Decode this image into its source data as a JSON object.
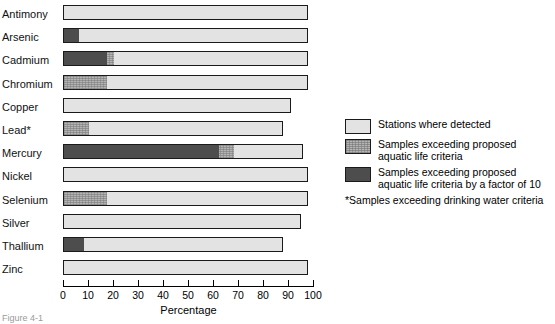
{
  "chart_data": {
    "type": "bar",
    "orientation": "horizontal",
    "stacked": true,
    "title": "",
    "xlabel": "Percentage",
    "ylabel": "",
    "xlim": [
      0,
      100
    ],
    "xticks": [
      0,
      10,
      20,
      30,
      40,
      50,
      60,
      70,
      80,
      90,
      100
    ],
    "xtick_labels": [
      "0",
      "10",
      "20",
      "30",
      "40",
      "50",
      "60",
      "70",
      "80",
      "90",
      "100"
    ],
    "grid": false,
    "legend_position": "right",
    "categories": [
      "Antimony",
      "Arsenic",
      "Cadmium",
      "Chromium",
      "Copper",
      "Lead*",
      "Mercury",
      "Nickel",
      "Selenium",
      "Silver",
      "Thallium",
      "Zinc"
    ],
    "series": [
      {
        "name": "Stations where detected",
        "key": "detected",
        "color": "#e3e3e3",
        "values": [
          98,
          98,
          98,
          98,
          91,
          88,
          96,
          98,
          98,
          95,
          88,
          98
        ]
      },
      {
        "name": "Samples exceeding proposed aquatic life criteria",
        "key": "aquatic",
        "color": "#b4b4b4",
        "values": [
          0,
          6,
          20,
          17,
          0,
          10,
          68,
          0,
          17,
          0,
          8,
          0
        ]
      },
      {
        "name": "Samples exceeding proposed aquatic life criteria by a factor of 10",
        "key": "aquatic_x10",
        "color": "#4d4d4d",
        "values": [
          0,
          6,
          17,
          0,
          0,
          0,
          62,
          0,
          0,
          0,
          8,
          0
        ]
      }
    ],
    "bars": [
      {
        "category": "Antimony",
        "detected": 98,
        "aquatic": 0,
        "aquatic_x10": 0
      },
      {
        "category": "Arsenic",
        "detected": 98,
        "aquatic": 6,
        "aquatic_x10": 6
      },
      {
        "category": "Cadmium",
        "detected": 98,
        "aquatic": 20,
        "aquatic_x10": 17
      },
      {
        "category": "Chromium",
        "detected": 98,
        "aquatic": 17,
        "aquatic_x10": 0
      },
      {
        "category": "Copper",
        "detected": 91,
        "aquatic": 0,
        "aquatic_x10": 0
      },
      {
        "category": "Lead*",
        "detected": 88,
        "aquatic": 10,
        "aquatic_x10": 0
      },
      {
        "category": "Mercury",
        "detected": 96,
        "aquatic": 68,
        "aquatic_x10": 62
      },
      {
        "category": "Nickel",
        "detected": 98,
        "aquatic": 0,
        "aquatic_x10": 0
      },
      {
        "category": "Selenium",
        "detected": 98,
        "aquatic": 17,
        "aquatic_x10": 0
      },
      {
        "category": "Silver",
        "detected": 95,
        "aquatic": 0,
        "aquatic_x10": 0
      },
      {
        "category": "Thallium",
        "detected": 88,
        "aquatic": 8,
        "aquatic_x10": 8
      },
      {
        "category": "Zinc",
        "detected": 98,
        "aquatic": 0,
        "aquatic_x10": 0
      }
    ]
  },
  "legend": {
    "items": [
      {
        "swatch": "light",
        "label": "Stations where detected"
      },
      {
        "swatch": "mid",
        "label": "Samples exceeding proposed\naquatic life criteria"
      },
      {
        "swatch": "dark",
        "label": "Samples exceeding proposed\naquatic life criteria by a factor of 10"
      }
    ],
    "footnote": "*Samples exceeding drinking water criteria"
  },
  "axis": {
    "x_title": "Percentage"
  },
  "caption": {
    "text": "Figure 4-1"
  }
}
